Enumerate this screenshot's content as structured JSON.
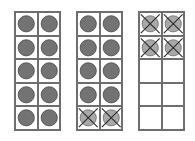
{
  "diagram": {
    "type": "ten-frames",
    "colors": {
      "filled": "#737373",
      "crossed": "#a8a8a8",
      "stroke": "#3a3a3a",
      "grid": "#6e6e6e"
    },
    "frames": [
      {
        "id": "frame-1",
        "left": 14,
        "cells": [
          "filled",
          "filled",
          "filled",
          "filled",
          "filled",
          "filled",
          "filled",
          "filled",
          "filled",
          "filled"
        ]
      },
      {
        "id": "frame-2",
        "left": 76,
        "cells": [
          "filled",
          "filled",
          "filled",
          "filled",
          "filled",
          "filled",
          "filled",
          "filled",
          "crossed",
          "crossed"
        ]
      },
      {
        "id": "frame-3",
        "left": 138,
        "cells": [
          "crossed",
          "crossed",
          "crossed",
          "crossed",
          "empty",
          "empty",
          "empty",
          "empty",
          "empty",
          "empty"
        ]
      }
    ]
  }
}
